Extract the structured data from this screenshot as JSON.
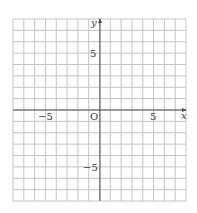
{
  "chart_data": {
    "type": "scatter",
    "title": "",
    "xlabel": "x",
    "ylabel": "y",
    "xlim": [
      -8,
      8
    ],
    "ylim": [
      -8,
      8
    ],
    "grid": true,
    "grid_step": 1,
    "x_ticks_labeled": [
      -5,
      5
    ],
    "y_ticks_labeled": [
      5,
      -5
    ],
    "tick_labels": {
      "x_neg": "−5",
      "x_pos": "5",
      "y_pos": "5",
      "y_neg": "−5",
      "origin": "O"
    },
    "series": [],
    "legend": null
  },
  "colors": {
    "grid": "#c4c4c4",
    "axis": "#505050",
    "text": "#3a3a3a"
  }
}
